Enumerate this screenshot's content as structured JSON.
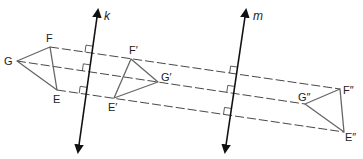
{
  "diagram": {
    "type": "geometry-reflection",
    "colors": {
      "line": "#111111",
      "triangle": "#666666",
      "dashed": "#333333",
      "label": "#222222",
      "background": "#ffffff"
    },
    "lines": {
      "k": {
        "label": "k",
        "x1": 78,
        "y1": 152,
        "x2": 98,
        "y2": 10,
        "label_x": 104,
        "label_y": 20
      },
      "m": {
        "label": "m",
        "x1": 225,
        "y1": 152,
        "x2": 246,
        "y2": 10,
        "label_x": 253,
        "label_y": 20
      }
    },
    "triangles": [
      {
        "name": "original",
        "vertices": {
          "G": {
            "label": "G",
            "x": 17,
            "y": 61,
            "lx": 4,
            "ly": 65
          },
          "F": {
            "label": "F",
            "x": 50,
            "y": 47,
            "lx": 46,
            "ly": 42
          },
          "E": {
            "label": "E",
            "x": 57,
            "y": 90,
            "lx": 53,
            "ly": 103
          }
        }
      },
      {
        "name": "first-image",
        "vertices": {
          "F": {
            "label": "F′",
            "x": 131,
            "y": 59,
            "lx": 129,
            "ly": 54
          },
          "G": {
            "label": "G′",
            "x": 158,
            "y": 82,
            "lx": 161,
            "ly": 81
          },
          "E": {
            "label": "E′",
            "x": 114,
            "y": 98,
            "lx": 108,
            "ly": 111
          }
        }
      },
      {
        "name": "second-image",
        "vertices": {
          "F": {
            "label": "F″",
            "x": 340,
            "y": 89,
            "lx": 343,
            "ly": 94
          },
          "G": {
            "label": "G″",
            "x": 305,
            "y": 104,
            "lx": 298,
            "ly": 101
          },
          "E": {
            "label": "E″",
            "x": 344,
            "y": 132,
            "lx": 345,
            "ly": 141
          }
        }
      }
    ],
    "dashed_segments": [
      {
        "name": "F-path",
        "x1": 50,
        "y1": 47,
        "x2": 340,
        "y2": 89
      },
      {
        "name": "G-path",
        "x1": 17,
        "y1": 61,
        "x2": 305,
        "y2": 104
      },
      {
        "name": "E-path",
        "x1": 57,
        "y1": 90,
        "x2": 344,
        "y2": 132
      }
    ]
  }
}
